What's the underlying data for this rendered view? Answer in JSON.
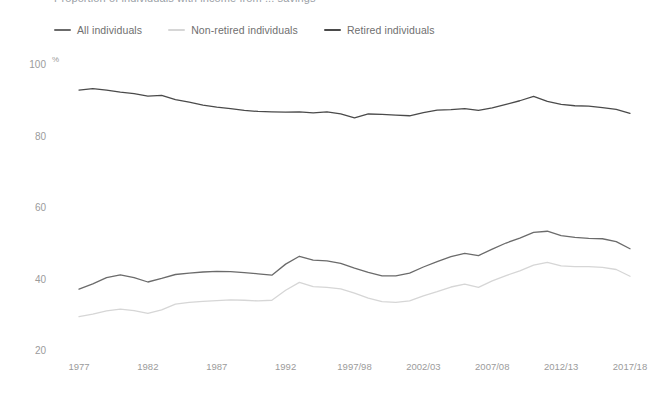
{
  "title_clipped": "Proportion of individuals with income from ... savings",
  "legend": {
    "position": "top-left",
    "items": [
      {
        "label": "All individuals",
        "color": "#6b6b6b",
        "key": "all"
      },
      {
        "label": "Non-retired individuals",
        "color": "#d6d6d6",
        "key": "non_retired"
      },
      {
        "label": "Retired individuals",
        "color": "#4a4a4a",
        "key": "retired"
      }
    ]
  },
  "axes": {
    "y_unit": "%",
    "y_ticks": [
      "100",
      "80",
      "60",
      "40",
      "20"
    ],
    "x_ticks": [
      "1977",
      "1982",
      "1987",
      "1992",
      "1997/98",
      "2002/03",
      "2007/08",
      "2012/13",
      "2017/18"
    ]
  },
  "chart_data": {
    "type": "line",
    "title": "",
    "xlabel": "",
    "ylabel": "%",
    "ylim": [
      20,
      100
    ],
    "yticks": [
      20,
      40,
      60,
      80,
      100
    ],
    "grid": false,
    "legend_position": "top-left",
    "x": [
      "1977",
      "1978",
      "1979",
      "1980",
      "1981",
      "1982",
      "1983",
      "1984",
      "1985",
      "1986",
      "1987",
      "1988",
      "1989",
      "1990",
      "1991",
      "1992",
      "1993",
      "1994/95",
      "1995/96",
      "1996/97",
      "1997/98",
      "1998/99",
      "1999/00",
      "2000/01",
      "2001/02",
      "2002/03",
      "2003/04",
      "2004/05",
      "2005/06",
      "2006/07",
      "2007/08",
      "2008/09",
      "2009/10",
      "2010/11",
      "2011/12",
      "2012/13",
      "2013/14",
      "2014/15",
      "2015/16",
      "2016/17",
      "2017/18"
    ],
    "x_tick_labels": [
      "1977",
      "1982",
      "1987",
      "1992",
      "1997/98",
      "2002/03",
      "2007/08",
      "2012/13",
      "2017/18"
    ],
    "series": [
      {
        "name": "Retired individuals",
        "color": "#4a4a4a",
        "values": [
          93.0,
          93.4,
          93.0,
          92.4,
          92.0,
          91.3,
          91.5,
          90.3,
          89.6,
          88.8,
          88.2,
          87.8,
          87.3,
          87.0,
          86.9,
          86.8,
          86.9,
          86.6,
          86.9,
          86.3,
          85.2,
          86.3,
          86.2,
          86.0,
          85.8,
          86.7,
          87.4,
          87.5,
          87.8,
          87.3,
          88.0,
          89.0,
          90.0,
          91.2,
          89.8,
          89.0,
          88.6,
          88.5,
          88.1,
          87.6,
          86.5
        ]
      },
      {
        "name": "All individuals",
        "color": "#6b6b6b",
        "values": [
          37.3,
          38.8,
          40.5,
          41.3,
          40.5,
          39.3,
          40.3,
          41.4,
          41.8,
          42.1,
          42.3,
          42.2,
          41.9,
          41.6,
          41.2,
          44.3,
          46.5,
          45.4,
          45.2,
          44.5,
          43.2,
          42.0,
          41.0,
          41.0,
          41.8,
          43.5,
          45.0,
          46.4,
          47.3,
          46.7,
          48.5,
          50.2,
          51.6,
          53.2,
          53.5,
          52.3,
          51.8,
          51.5,
          51.4,
          50.6,
          48.6
        ]
      },
      {
        "name": "Non-retired individuals",
        "color": "#d6d6d6",
        "values": [
          29.6,
          30.3,
          31.2,
          31.7,
          31.3,
          30.5,
          31.5,
          33.1,
          33.6,
          33.9,
          34.1,
          34.3,
          34.2,
          34.0,
          34.2,
          37.0,
          39.2,
          38.0,
          37.8,
          37.4,
          36.2,
          34.8,
          33.8,
          33.6,
          34.0,
          35.4,
          36.6,
          37.9,
          38.7,
          37.8,
          39.6,
          41.1,
          42.4,
          44.0,
          44.8,
          43.8,
          43.6,
          43.6,
          43.4,
          42.8,
          40.9
        ]
      }
    ]
  },
  "geometry": {
    "plot_left": 79,
    "plot_right": 630,
    "y_100_px": 65,
    "px_per_unit": 3.575
  }
}
